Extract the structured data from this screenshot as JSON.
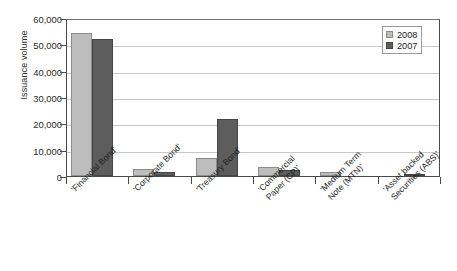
{
  "chart_data": {
    "type": "bar",
    "title": "",
    "xlabel": "",
    "ylabel": "Issuance volume",
    "ylim": [
      0,
      60000
    ],
    "ytick_labels": [
      "0",
      "10,000",
      "20,000",
      "30,000",
      "40,000",
      "50,000",
      "60,000"
    ],
    "ytick_values": [
      0,
      10000,
      20000,
      30000,
      40000,
      50000,
      60000
    ],
    "grid": true,
    "legend_position": "top-right",
    "categories": [
      "'Financial Bond'",
      "'Corporate Bond'",
      "'Treasury Bond'",
      "'Commercial Paper (CP)'",
      "'Medium Term Note (MTN)'",
      "'Asset backed Securities (ABS)'"
    ],
    "category_lines": [
      [
        "'Financial Bond'"
      ],
      [
        "'Corporate Bond'"
      ],
      [
        "'Treasury Bond'"
      ],
      [
        "'Commercial",
        "Paper (CP)'"
      ],
      [
        "'Medium Term",
        "Note (MTN)'"
      ],
      [
        "'Asset backed",
        "Securities (ABS)'"
      ]
    ],
    "series": [
      {
        "name": "2008",
        "color": "#bdbdbd",
        "values": [
          54200,
          2700,
          7000,
          3400,
          1500,
          0
        ]
      },
      {
        "name": "2007",
        "color": "#5d5d5d",
        "values": [
          52000,
          1500,
          21500,
          2400,
          0,
          350
        ]
      }
    ]
  },
  "legend": {
    "items": [
      {
        "label": "2008"
      },
      {
        "label": "2007"
      }
    ]
  }
}
